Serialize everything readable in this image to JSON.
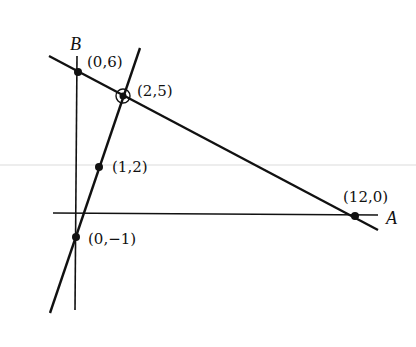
{
  "diagram": {
    "type": "linear-programming-graph",
    "axes": {
      "horizontal": {
        "label": "A"
      },
      "vertical": {
        "label": "B"
      }
    },
    "lines": [
      {
        "name": "constraint-line-1",
        "through": [
          "(0,6)",
          "(12,0)"
        ]
      },
      {
        "name": "constraint-line-2",
        "through": [
          "(0,-1)",
          "(1,2)"
        ]
      }
    ],
    "points": [
      {
        "label": "(0,6)",
        "highlighted": false
      },
      {
        "label": "(2,5)",
        "highlighted": true
      },
      {
        "label": "(1,2)",
        "highlighted": false
      },
      {
        "label": "(12,0)",
        "highlighted": false
      },
      {
        "label": "(0,−1)",
        "highlighted": false
      }
    ],
    "colors": {
      "ink": "#111111",
      "artifact_line": "#d9d9d9"
    }
  }
}
